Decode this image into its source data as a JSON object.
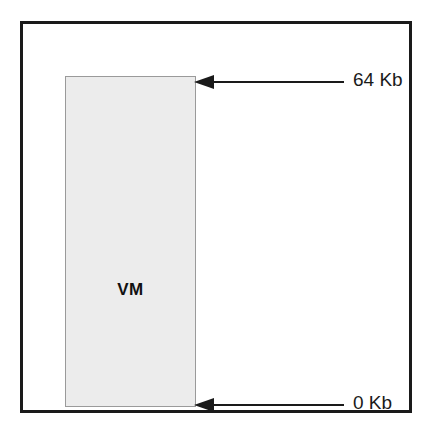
{
  "diagram": {
    "block": {
      "label": "VM",
      "fill_color": "#ececec",
      "border_color": "#9a9a9a"
    },
    "frame": {
      "border_color": "#1a1a1a"
    },
    "annotations": [
      {
        "name": "top-address-annotation",
        "label": "64 Kb",
        "arrow": "left-arrow-icon",
        "points_to": "top of VM block"
      },
      {
        "name": "bottom-address-annotation",
        "label": "0 Kb",
        "arrow": "left-arrow-icon",
        "points_to": "bottom of VM block"
      }
    ]
  }
}
